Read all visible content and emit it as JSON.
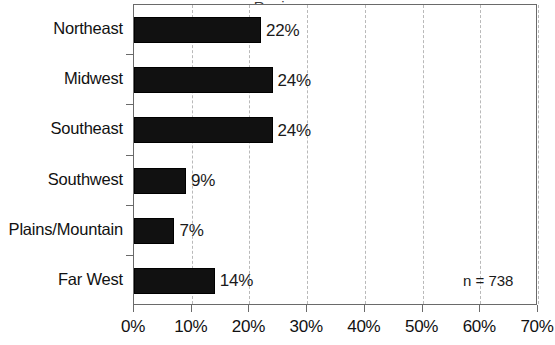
{
  "chart_data": {
    "type": "bar",
    "orientation": "horizontal",
    "title": "",
    "xlabel": "",
    "ylabel": "",
    "categories": [
      "Northeast",
      "Midwest",
      "Southeast",
      "Southwest",
      "Plains/Mountain",
      "Far West"
    ],
    "values": [
      22,
      24,
      24,
      9,
      7,
      14
    ],
    "value_labels": [
      "22%",
      "24%",
      "24%",
      "9%",
      "7%",
      "14%"
    ],
    "xlim": [
      0,
      70
    ],
    "xticks": [
      0,
      10,
      20,
      30,
      40,
      50,
      60,
      70
    ],
    "xtick_labels": [
      "0%",
      "10%",
      "20%",
      "30%",
      "40%",
      "50%",
      "60%",
      "70%"
    ],
    "grid": true,
    "grid_axis": "x",
    "grid_style": "dashed",
    "legend": false,
    "annotations": [
      {
        "text": "n = 738",
        "x": 57,
        "y": 0
      }
    ],
    "colors": {
      "bar_fill": "#111111",
      "bar_edge": "#000000",
      "grid": "#b9b9b9",
      "axis": "#6a6a6a",
      "text": "#111111",
      "background": "#ffffff"
    }
  },
  "annotation": {
    "sample_size": "n = 738"
  },
  "title_fragment": "Region"
}
